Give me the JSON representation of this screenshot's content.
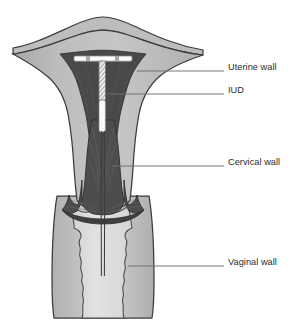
{
  "figure": {
    "type": "medical-anatomical-diagram",
    "width": 303,
    "height": 331,
    "background_color": "#ffffff"
  },
  "labels": [
    {
      "id": "uterine-wall",
      "text": "Uterine wall",
      "text_x": 228,
      "text_y": 62,
      "leader_from_x": 137,
      "leader_from_y": 71,
      "leader_to_x": 224,
      "leader_to_y": 71
    },
    {
      "id": "iud",
      "text": "IUD",
      "text_x": 228,
      "text_y": 85,
      "leader_from_x": 105,
      "leader_from_y": 94,
      "leader_to_x": 224,
      "leader_to_y": 94
    },
    {
      "id": "cervical-wall",
      "text": "Cervical wall",
      "text_x": 228,
      "text_y": 157,
      "leader_from_x": 112,
      "leader_from_y": 166,
      "leader_to_x": 224,
      "leader_to_y": 166
    },
    {
      "id": "vaginal-wall",
      "text": "Vaginal wall",
      "text_x": 228,
      "text_y": 257,
      "leader_from_x": 128,
      "leader_from_y": 266,
      "leader_to_x": 224,
      "leader_to_y": 266
    }
  ],
  "colors": {
    "uterine_wall_fill": "#b4b4b4",
    "uterine_wall_fill_light": "#c3c3c3",
    "myometrium_outer": "#a9a9a9",
    "endometrium_dark": "#4a4a4a",
    "cavity_dark": "#3d3d3d",
    "cervical_canal": "#555555",
    "vaginal_wall_fill": "#bdbdbd",
    "vaginal_lumen_fill": "#dcdcdc",
    "iud_white": "#fafafa",
    "iud_hatch": "#8a8a8a",
    "outline": "#3a3a3a",
    "leader_line": "#6f6f6f",
    "label_text": "#2b2b2b"
  },
  "structures": [
    {
      "id": "uterine-fundus",
      "name": "Uterine fundus and body (uterine wall)"
    },
    {
      "id": "uterine-cavity",
      "name": "Uterine cavity / endometrial lining"
    },
    {
      "id": "iud-device",
      "name": "T-shaped intrauterine device"
    },
    {
      "id": "iud-crossarm",
      "name": "IUD horizontal cross arm"
    },
    {
      "id": "iud-stem",
      "name": "IUD vertical stem with copper coil"
    },
    {
      "id": "iud-strings",
      "name": "IUD monofilament strings extending into vagina"
    },
    {
      "id": "cervix",
      "name": "Cervix and cervical canal"
    },
    {
      "id": "cervical-os",
      "name": "External cervical os"
    },
    {
      "id": "vagina",
      "name": "Vaginal canal with rugae"
    }
  ]
}
